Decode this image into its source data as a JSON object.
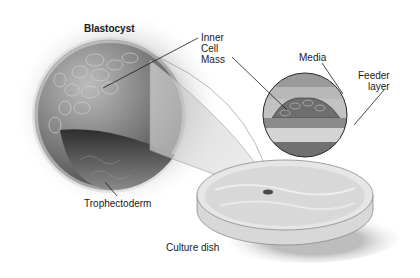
{
  "diagram": {
    "title": "Blastocyst",
    "labels": {
      "inner_cell_mass": [
        "Inner",
        "Cell",
        "Mass"
      ],
      "trophectoderm": "Trophectoderm",
      "media": "Media",
      "feeder_layer": [
        "Feeder",
        "layer"
      ],
      "culture_dish": "Culture dish"
    },
    "colors": {
      "background": "#ffffff",
      "sphere_dark": "#4a4a4a",
      "sphere_light": "#bdbdbd",
      "text": "#1a1a1a"
    }
  }
}
